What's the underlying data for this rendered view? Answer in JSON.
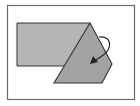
{
  "diagram": {
    "type": "fold-illustration",
    "colors": {
      "background": "#ffffff",
      "frame": "#6a6a6a",
      "rectangle_fill": "#b5b5b5",
      "folded_fill": "#a3a3a3",
      "outline": "#333333",
      "arrow": "#222222"
    },
    "frame": {
      "x": 7,
      "y": 5,
      "width": 128,
      "height": 95
    },
    "rectangle": {
      "points": "17,23 90,23 66,66 17,66"
    },
    "folded_flap": {
      "points": "90,23 112,64 102,83 54,83"
    },
    "arrow": {
      "path": "M99,37 C108,36 112,42 108,50 C105,55 99,58 94,61",
      "head": "90,64 93,56 98,62",
      "label": ""
    }
  }
}
